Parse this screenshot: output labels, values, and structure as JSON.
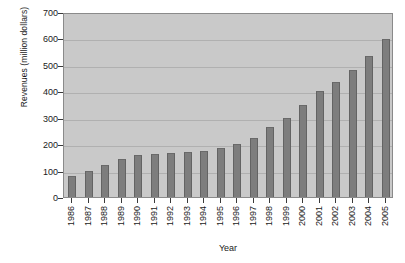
{
  "chart_data": {
    "type": "bar",
    "title": "",
    "xlabel": "Year",
    "ylabel": "Revenues (million dollars)",
    "categories": [
      "1986",
      "1987",
      "1988",
      "1989",
      "1990",
      "1991",
      "1992",
      "1993",
      "1994",
      "1995",
      "1996",
      "1997",
      "1998",
      "1999",
      "2000",
      "2001",
      "2002",
      "2003",
      "2004",
      "2005"
    ],
    "values": [
      80,
      98,
      122,
      143,
      158,
      163,
      167,
      170,
      176,
      186,
      200,
      225,
      265,
      300,
      350,
      400,
      437,
      482,
      533,
      597
    ],
    "ylim": [
      0,
      700
    ],
    "ytick_values": [
      0,
      100,
      200,
      300,
      400,
      500,
      600,
      700
    ],
    "ytick_labels": [
      "0",
      "100",
      "200",
      "300",
      "400",
      "500",
      "600",
      "700"
    ],
    "grid": true,
    "legend": false,
    "legend_position": "none",
    "bar_color": "#7d7d7d",
    "plot_background_color": "#c9c9c9",
    "figure_background_color": "#ffffff",
    "gridline_color": "#b0b0b0",
    "axis_color": "#3a3a3a",
    "series": [
      {
        "name": "Revenues",
        "values": [
          80,
          98,
          122,
          143,
          158,
          163,
          167,
          170,
          176,
          186,
          200,
          225,
          265,
          300,
          350,
          400,
          437,
          482,
          533,
          597
        ]
      }
    ]
  }
}
